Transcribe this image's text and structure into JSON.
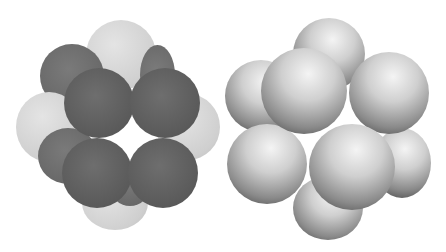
{
  "figure": {
    "panels": [
      {
        "name": "flat-shaded-cluster",
        "description": "Cluster of 13 spheres with flat dark and light gray shading"
      },
      {
        "name": "shaded-cluster",
        "description": "Cluster of 13 spheres with 3D gradient shading"
      }
    ],
    "colors": {
      "dark_sphere": "#5e5e5e",
      "light_sphere": "#d2d2d2",
      "background": "#ffffff"
    }
  }
}
